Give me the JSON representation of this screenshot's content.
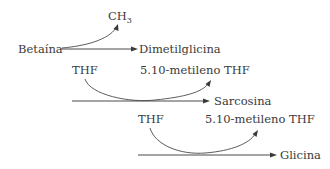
{
  "diagram": {
    "type": "metabolic-pathway",
    "steps": [
      {
        "substrate": "Betaína",
        "product": "Dimetilglicina",
        "released": "CH",
        "released_subscript": "3"
      },
      {
        "cofactor_in": "THF",
        "cofactor_out": "5.10-metileno THF",
        "product": "Sarcosina"
      },
      {
        "cofactor_in": "THF",
        "cofactor_out": "5.10-metileno THF",
        "product": "Glicina"
      }
    ]
  },
  "colors": {
    "text": "#3a3a3a",
    "arrow": "#4a4a4a",
    "background": "#ffffff"
  }
}
